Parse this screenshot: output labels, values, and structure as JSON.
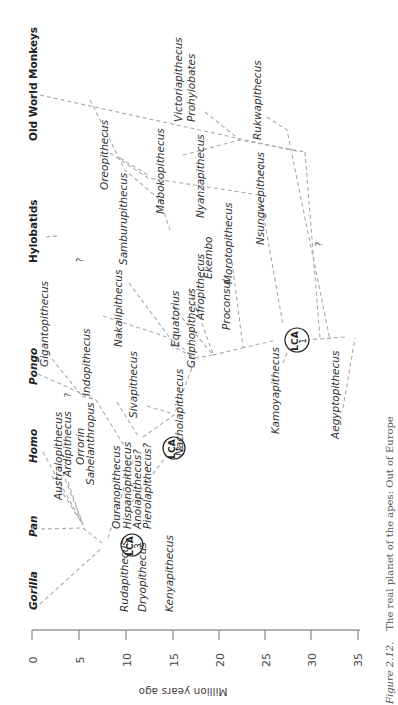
{
  "figure": {
    "caption_label": "Figure 2.12.",
    "caption_text": "The real planet of the apes: Out of Europe",
    "orientation": "rotated 90° counter-clockwise"
  },
  "axis": {
    "label": "Million years ago",
    "ticks": [
      "0",
      "5",
      "10",
      "15",
      "20",
      "25",
      "30",
      "35"
    ]
  },
  "clades": {
    "gorilla": "Gorilla",
    "pan": "Pan",
    "homo": "Homo",
    "pongo": "Pongo",
    "hylobatids": "Hylobatids",
    "owm": "Old World Monkeys"
  },
  "taxa": {
    "rudapithecus": "Rudapithecus",
    "dryopithecus": "Dryopithecus",
    "kenyapithecus": "Kenyapithecus",
    "ouranopithecus": "Ouranopithecus",
    "hispanopithecus": "Hispanopithecus",
    "anoiapithecus": "Anoiapithecus?",
    "pierolapithecus": "Pierolapithecus?",
    "australopithecus": "Australopithecus",
    "ardipithecus": "Ardipithecus",
    "orrorin": "Orrorin",
    "sahelanthropus": "Sahelanthropus",
    "sivapithecus": "Sivapithecus",
    "nacholapithecus": "Nacholapithecus",
    "gigantopithecus": "Gigantopithecus",
    "indopithecus": "Indopithecus",
    "nakalipithecus": "Nakalipithecus",
    "equatorius": "Equatorius",
    "griphopithecus": "Griphopithecus",
    "afropithecus": "Afropithecus",
    "ekembo": "Ekembo",
    "proconsul": "Proconsul",
    "morotopithecus": "Morotopithecus",
    "samburupithecus": "Samburupithecus",
    "kamoyapithecus": "Kamoyapithecus",
    "aegyptopithecus": "Aegyptopithecus",
    "oreopithecus": "Oreopithecus",
    "mabokopithecus": "Mabokopithecus",
    "nyanzapithecus": "Nyanzapithecus",
    "nsungwepithecus": "Nsungwepithecus",
    "victoriapithecus": "Victoriapithecus",
    "prohylobates": "Prohylobates",
    "rukwapithecus": "Rukwapithecus"
  },
  "lca": [
    {
      "label": "LCA",
      "num": "1"
    },
    {
      "label": "LCA",
      "num": "2"
    },
    {
      "label": "LCA",
      "num": "3"
    }
  ],
  "uncertain_mark": "?"
}
